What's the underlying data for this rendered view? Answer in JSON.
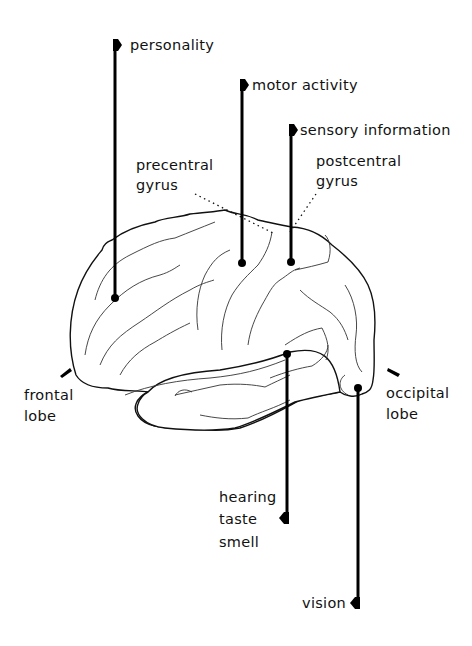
{
  "diagram": {
    "type": "labelled anatomical illustration",
    "labels": {
      "personality": "personality",
      "motor_activity": "motor activity",
      "sensory_information": "sensory information",
      "precentral_gyrus": [
        "precentral",
        "gyrus"
      ],
      "postcentral_gyrus": [
        "postcentral",
        "gyrus"
      ],
      "frontal_lobe": [
        "frontal",
        "lobe"
      ],
      "occipital_lobe": [
        "occipital",
        "lobe"
      ],
      "temporal_functions": [
        "hearing",
        "taste",
        "smell"
      ],
      "vision": "vision"
    },
    "colors": {
      "ink": "#000000",
      "background": "#ffffff"
    }
  }
}
